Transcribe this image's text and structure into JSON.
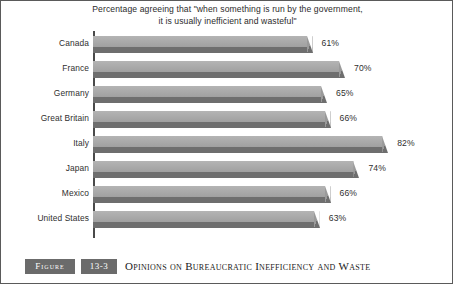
{
  "title": {
    "line1": "Percentage agreeing that \"when something is run by the government,",
    "line2": "it is usually inefficient and wasteful\""
  },
  "caption": {
    "figure_word": "Figure",
    "number": "13-3",
    "text": "Opinions on Bureaucratic Inefficiency and Waste"
  },
  "rows": [
    {
      "country": "Canada",
      "label": "61%",
      "value": 61
    },
    {
      "country": "France",
      "label": "70%",
      "value": 70
    },
    {
      "country": "Germany",
      "label": "65%",
      "value": 65
    },
    {
      "country": "Great Britain",
      "label": "66%",
      "value": 66
    },
    {
      "country": "Italy",
      "label": "82%",
      "value": 82
    },
    {
      "country": "Japan",
      "label": "74%",
      "value": 74
    },
    {
      "country": "Mexico",
      "label": "66%",
      "value": 66
    },
    {
      "country": "United States",
      "label": "63%",
      "value": 63
    }
  ],
  "colors": {
    "bar_face": "#a9a9a9",
    "bar_shadow": "#6e6e6e",
    "axis": "#4a4a4a",
    "caption_bar": "#6b6b6b",
    "text": "#2f2f2f"
  },
  "chart_data": {
    "type": "bar",
    "orientation": "horizontal",
    "title": "Percentage agreeing that \"when something is run by the government, it is usually inefficient and wasteful\"",
    "subtitle": "",
    "xlabel": "",
    "ylabel": "",
    "categories": [
      "Canada",
      "France",
      "Germany",
      "Great Britain",
      "Italy",
      "Japan",
      "Mexico",
      "United States"
    ],
    "values": [
      61,
      70,
      65,
      66,
      82,
      74,
      66,
      63
    ],
    "data_labels": [
      "61%",
      "70%",
      "65%",
      "66%",
      "82%",
      "74%",
      "66%",
      "63%"
    ],
    "unit": "percent",
    "xlim": [
      0,
      100
    ],
    "grid": false,
    "legend": null
  }
}
